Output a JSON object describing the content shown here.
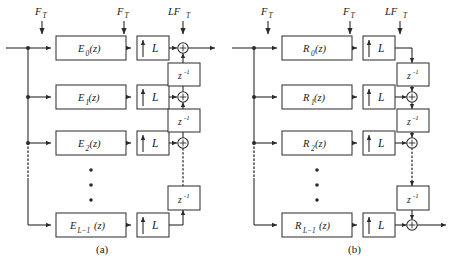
{
  "figure": {
    "type": "block-diagram",
    "panels": [
      {
        "id": "a",
        "caption": "(a)",
        "rate_labels": [
          {
            "name": "input-rate",
            "main": "F",
            "sub": "T"
          },
          {
            "name": "prefilter-rate",
            "main": "F",
            "sub": "T"
          },
          {
            "name": "output-rate",
            "main": "LF",
            "sub": "T"
          }
        ],
        "branches": [
          {
            "filter_main": "E",
            "filter_sub": "0",
            "filter_arg": "(z)",
            "upsampler": "L",
            "delay": "z",
            "delay_exp": "-1",
            "has_adder": true
          },
          {
            "filter_main": "E",
            "filter_sub": "1",
            "filter_arg": "(z)",
            "upsampler": "L",
            "delay": "z",
            "delay_exp": "-1",
            "has_adder": true
          },
          {
            "filter_main": "E",
            "filter_sub": "2",
            "filter_arg": "(z)",
            "upsampler": "L",
            "delay": "z",
            "delay_exp": "-1",
            "has_adder": true
          },
          {
            "filter_main": "E",
            "filter_sub": "L−1",
            "filter_arg": "(z)",
            "upsampler": "L",
            "delay": null,
            "delay_exp": null,
            "has_adder": false
          }
        ],
        "vertical_dots": "• • •"
      },
      {
        "id": "b",
        "caption": "(b)",
        "rate_labels": [
          {
            "name": "input-rate",
            "main": "F",
            "sub": "T"
          },
          {
            "name": "prefilter-rate",
            "main": "F",
            "sub": "T"
          },
          {
            "name": "output-rate",
            "main": "LF",
            "sub": "T"
          }
        ],
        "branches": [
          {
            "filter_main": "R",
            "filter_sub": "0",
            "filter_arg": "(z)",
            "upsampler": "L",
            "delay": "z",
            "delay_exp": "-1",
            "has_adder": false
          },
          {
            "filter_main": "R",
            "filter_sub": "1",
            "filter_arg": "(z)",
            "upsampler": "L",
            "delay": "z",
            "delay_exp": "-1",
            "has_adder": true
          },
          {
            "filter_main": "R",
            "filter_sub": "2",
            "filter_arg": "(z)",
            "upsampler": "L",
            "delay": "z",
            "delay_exp": "-1",
            "has_adder": true
          },
          {
            "filter_main": "R",
            "filter_sub": "L−1",
            "filter_arg": "(z)",
            "upsampler": "L",
            "delay": null,
            "delay_exp": null,
            "has_adder": true
          }
        ],
        "vertical_dots": "• • •"
      }
    ],
    "colors": {
      "background": "#ffffff",
      "line": "#2b2b2b",
      "box_stroke": "#3c3c3c",
      "text": "#1a1a1a"
    }
  }
}
